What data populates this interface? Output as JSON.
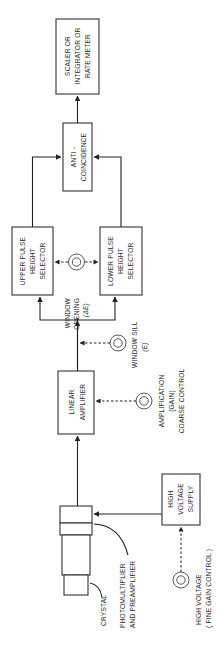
{
  "diagram": {
    "title": "",
    "orientation": "rotated-90-ccw",
    "blocks": {
      "scaler": {
        "lines": [
          "SCALER OR",
          "INTEGRATOR OR",
          "RATE METER"
        ]
      },
      "anticoincidence": {
        "lines": [
          "ANTI -",
          "COINCIDENCE"
        ]
      },
      "upper_phs": {
        "lines": [
          "UPPER PULSE",
          "HEIGHT",
          "SELECTOR"
        ]
      },
      "lower_phs": {
        "lines": [
          "LOWER PULSE",
          "HEIGHT",
          "SELECTOR"
        ]
      },
      "linear_amp": {
        "lines": [
          "LINEAR",
          "AMPLIFIER"
        ]
      },
      "hv_supply": {
        "lines": [
          "HIGH",
          "VOLTAGE",
          "SUPPLY"
        ]
      }
    },
    "controls": {
      "window_opening": {
        "lines": [
          "WINDOW",
          "OPENING",
          "(ΔE)"
        ]
      },
      "window_sill": {
        "lines": [
          "WINDOW SILL",
          "(E)"
        ]
      },
      "amplification": {
        "lines": [
          "AMPLIFICATION",
          "(GAIN)",
          "COARSE CONTROL"
        ]
      },
      "high_voltage": {
        "lines": [
          "HIGH VOLTAGE",
          "( FINE GAIN CONTROL )"
        ]
      }
    },
    "detector_labels": {
      "crystal": "CRYSTAL",
      "pmt": [
        "PHOTOMULTIPLIER",
        "AND PREAMPLIFIER"
      ]
    },
    "colors": {
      "line": "#222222",
      "background": "#ffffff"
    }
  }
}
